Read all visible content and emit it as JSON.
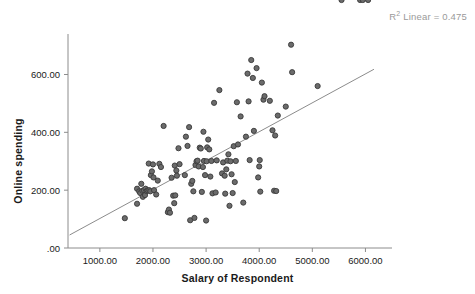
{
  "chart_data": {
    "type": "scatter",
    "title": "",
    "xlabel": "Salary of Respondent",
    "ylabel": "Online spending",
    "annotation": "R² Linear = 0.475",
    "annotation_prefix": "R",
    "annotation_sup": "2",
    "annotation_suffix": " Linear = 0.475",
    "r_squared": 0.475,
    "grid": false,
    "legend": false,
    "xlim": [
      400,
      6500
    ],
    "ylim": [
      0,
      740
    ],
    "xticks": [
      1000,
      2000,
      3000,
      4000,
      5000,
      6000
    ],
    "xtick_labels": [
      "1000.00",
      "2000.00",
      "3000.00",
      "4000.00",
      "5000.00",
      "6000.00"
    ],
    "yticks": [
      0,
      200,
      400,
      600
    ],
    "ytick_labels": [
      ".00",
      "200.00",
      "400.00",
      "600.00"
    ],
    "marker_color": "#6b6b6b",
    "marker_edge_color": "#3a3a3a",
    "axis_color": "#8c8c8c",
    "fit_line": {
      "type": "linear",
      "color": "#8c8c8c",
      "x_start": 430,
      "y_start": 45,
      "x_end": 6160,
      "y_end": 618
    },
    "x": [
      1470,
      1700,
      1700,
      1740,
      1760,
      1780,
      1800,
      1810,
      1830,
      1850,
      1860,
      1880,
      1900,
      1920,
      1930,
      1950,
      1960,
      1980,
      2000,
      2010,
      2020,
      2060,
      2090,
      2120,
      2150,
      2200,
      2280,
      2300,
      2320,
      2350,
      2380,
      2400,
      2410,
      2420,
      2440,
      2450,
      2480,
      2500,
      2600,
      2620,
      2650,
      2680,
      2700,
      2720,
      2740,
      2760,
      2780,
      2800,
      2820,
      2840,
      2860,
      2880,
      2900,
      2920,
      2940,
      2950,
      2960,
      2980,
      3000,
      3010,
      3020,
      3040,
      3060,
      3080,
      3100,
      3120,
      3150,
      3180,
      3200,
      3250,
      3300,
      3320,
      3350,
      3360,
      3380,
      3400,
      3420,
      3440,
      3460,
      3480,
      3500,
      3520,
      3540,
      3560,
      3580,
      3600,
      3650,
      3700,
      3750,
      3780,
      3800,
      3820,
      3850,
      3880,
      3900,
      3950,
      3980,
      4000,
      4010,
      4020,
      4050,
      4080,
      4100,
      4200,
      4250,
      4280,
      4300,
      4320,
      4350,
      4500,
      4600,
      4620,
      5100,
      5550,
      5900,
      5950,
      6050
    ],
    "y": [
      103,
      205,
      153,
      196,
      190,
      222,
      198,
      177,
      200,
      183,
      205,
      197,
      199,
      292,
      200,
      196,
      252,
      265,
      289,
      244,
      200,
      185,
      233,
      291,
      280,
      422,
      124,
      133,
      122,
      243,
      181,
      155,
      285,
      182,
      268,
      250,
      345,
      290,
      252,
      385,
      353,
      418,
      96,
      222,
      232,
      196,
      104,
      287,
      300,
      302,
      282,
      347,
      344,
      194,
      280,
      402,
      301,
      252,
      95,
      300,
      348,
      375,
      341,
      247,
      301,
      189,
      502,
      192,
      303,
      546,
      258,
      296,
      250,
      188,
      272,
      302,
      324,
      146,
      300,
      255,
      190,
      352,
      228,
      301,
      504,
      358,
      455,
      157,
      385,
      603,
      507,
      304,
      650,
      588,
      405,
      622,
      244,
      282,
      304,
      195,
      572,
      513,
      525,
      509,
      407,
      198,
      389,
      197,
      458,
      489,
      703,
      608,
      560
    ]
  }
}
